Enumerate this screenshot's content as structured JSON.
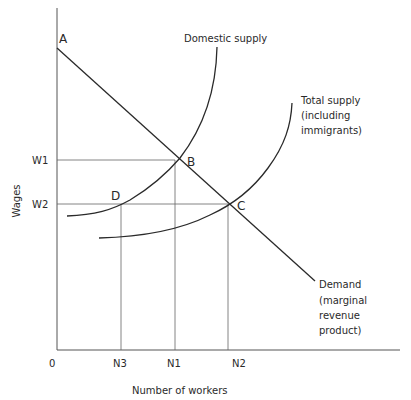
{
  "diagram": {
    "type": "labour-market supply-demand diagram",
    "axes": {
      "y_label": "Wages",
      "x_label": "Number of workers",
      "origin_label": "0",
      "y_ticks": [
        "W1",
        "W2"
      ],
      "x_ticks": [
        "N3",
        "N1",
        "N2"
      ]
    },
    "points": {
      "A": "A",
      "B": "B",
      "C": "C",
      "D": "D"
    },
    "curves": {
      "domestic_supply": {
        "label": "Domestic supply"
      },
      "total_supply": {
        "label_lines": [
          "Total supply",
          "(including",
          "immigrants)"
        ]
      },
      "demand": {
        "label_lines": [
          "Demand",
          "(marginal",
          "revenue",
          "product)"
        ]
      }
    },
    "line_color": "#2a2a2a",
    "guide_color": "#555555"
  }
}
